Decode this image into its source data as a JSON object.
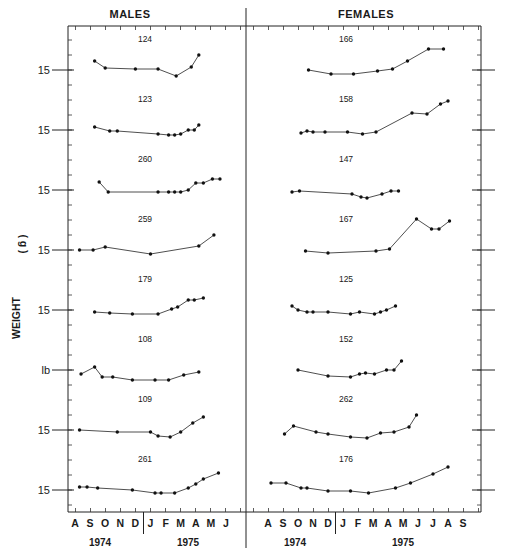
{
  "chart_data": {
    "type": "line",
    "title": "",
    "ylabel": "WEIGHT (g)",
    "xlabel": "",
    "reference_label": "15",
    "reference_unit": "g",
    "grid": false,
    "panels": [
      {
        "title": "MALES",
        "months": [
          "A",
          "S",
          "O",
          "N",
          "D",
          "J",
          "F",
          "M",
          "A",
          "M",
          "J"
        ],
        "years": [
          {
            "label": "1974",
            "span": [
              "A",
              "D"
            ]
          },
          {
            "label": "1975",
            "span": [
              "J",
              "J"
            ]
          }
        ],
        "series": [
          {
            "name": "124",
            "x": [
              1.3,
              2.0,
              4.0,
              5.5,
              6.7,
              7.7,
              8.2
            ],
            "y": [
              15.9,
              15.2,
              15.1,
              15.1,
              14.4,
              15.3,
              16.5
            ]
          },
          {
            "name": "123",
            "x": [
              1.3,
              2.3,
              2.8,
              5.5,
              6.2,
              6.6,
              7.0,
              7.5,
              7.9,
              8.2
            ],
            "y": [
              15.3,
              14.9,
              14.9,
              14.6,
              14.5,
              14.5,
              14.6,
              15.0,
              15.0,
              15.5
            ]
          },
          {
            "name": "260",
            "x": [
              1.6,
              2.2,
              5.5,
              6.2,
              6.6,
              7.0,
              7.5,
              8.0,
              8.5,
              9.1,
              9.6
            ],
            "y": [
              15.8,
              14.8,
              14.8,
              14.8,
              14.8,
              14.8,
              15.0,
              15.7,
              15.7,
              16.1,
              16.1
            ]
          },
          {
            "name": "259",
            "x": [
              0.3,
              1.2,
              2.0,
              5.0,
              8.2,
              9.2
            ],
            "y": [
              15.0,
              15.0,
              15.3,
              14.6,
              15.4,
              16.5
            ]
          },
          {
            "name": "179",
            "x": [
              1.3,
              2.3,
              3.8,
              5.5,
              6.4,
              6.8,
              7.5,
              7.9,
              8.5
            ],
            "y": [
              14.8,
              14.7,
              14.6,
              14.6,
              15.1,
              15.3,
              16.0,
              16.0,
              16.2
            ]
          },
          {
            "name": "108",
            "x": [
              0.4,
              1.3,
              1.8,
              2.5,
              3.8,
              5.3,
              6.2,
              7.2,
              8.2
            ],
            "y": [
              14.6,
              15.3,
              14.3,
              14.3,
              14.0,
              14.0,
              14.0,
              14.5,
              14.8
            ]
          },
          {
            "name": "109",
            "x": [
              0.3,
              2.8,
              5.0,
              5.5,
              6.3,
              7.0,
              7.8,
              8.5
            ],
            "y": [
              15.0,
              14.8,
              14.8,
              14.4,
              14.3,
              14.8,
              15.7,
              16.3
            ]
          },
          {
            "name": "261",
            "x": [
              0.3,
              0.8,
              1.5,
              3.8,
              5.3,
              5.7,
              6.6,
              7.5,
              8.0,
              8.5,
              9.5
            ],
            "y": [
              15.3,
              15.3,
              15.2,
              15.0,
              14.7,
              14.7,
              14.7,
              15.2,
              15.6,
              16.1,
              16.7
            ]
          }
        ]
      },
      {
        "title": "FEMALES",
        "months": [
          "A",
          "S",
          "O",
          "N",
          "D",
          "J",
          "F",
          "M",
          "A",
          "M",
          "J",
          "J",
          "A",
          "S"
        ],
        "years": [
          {
            "label": "1974",
            "span": [
              "A",
              "D"
            ]
          },
          {
            "label": "1975",
            "span": [
              "J",
              "S"
            ]
          }
        ],
        "series": [
          {
            "name": "166",
            "x": [
              2.7,
              4.2,
              5.7,
              7.3,
              8.3,
              9.3,
              10.7,
              11.7
            ],
            "y": [
              15.0,
              14.6,
              14.6,
              14.9,
              15.1,
              15.9,
              17.1,
              17.1
            ]
          },
          {
            "name": "158",
            "x": [
              2.2,
              2.6,
              3.0,
              3.8,
              5.3,
              6.3,
              7.2,
              9.6,
              10.6,
              11.5,
              12.0
            ],
            "y": [
              14.7,
              14.9,
              14.8,
              14.8,
              14.8,
              14.6,
              14.8,
              16.7,
              16.6,
              17.6,
              17.9
            ]
          },
          {
            "name": "147",
            "x": [
              1.6,
              2.1,
              5.6,
              6.2,
              6.6,
              7.6,
              8.2,
              8.7
            ],
            "y": [
              14.8,
              14.9,
              14.6,
              14.3,
              14.2,
              14.6,
              14.9,
              14.9
            ]
          },
          {
            "name": "167",
            "x": [
              2.5,
              4.0,
              7.2,
              8.1,
              9.9,
              10.9,
              11.4,
              12.1
            ],
            "y": [
              14.9,
              14.7,
              14.9,
              15.1,
              18.1,
              17.1,
              17.1,
              17.9
            ]
          },
          {
            "name": "125",
            "x": [
              1.6,
              2.0,
              2.6,
              3.0,
              4.0,
              5.5,
              6.1,
              7.1,
              7.5,
              7.9,
              8.5
            ],
            "y": [
              15.4,
              15.0,
              14.8,
              14.8,
              14.8,
              14.6,
              14.8,
              14.6,
              14.8,
              15.0,
              15.4
            ]
          },
          {
            "name": "152",
            "x": [
              2.0,
              4.0,
              5.5,
              6.1,
              6.5,
              7.1,
              7.9,
              8.4,
              8.9
            ],
            "y": [
              15.0,
              14.4,
              14.3,
              14.6,
              14.7,
              14.6,
              15.0,
              15.0,
              15.9
            ]
          },
          {
            "name": "262",
            "x": [
              1.1,
              1.7,
              3.2,
              4.0,
              5.5,
              6.6,
              7.5,
              8.4,
              9.4,
              9.9
            ],
            "y": [
              14.6,
              15.4,
              14.8,
              14.6,
              14.3,
              14.2,
              14.7,
              14.8,
              15.3,
              16.5
            ]
          },
          {
            "name": "176",
            "x": [
              0.2,
              1.2,
              2.2,
              2.6,
              4.0,
              5.5,
              6.7,
              8.5,
              9.5,
              11.0,
              12.0
            ],
            "y": [
              15.7,
              15.7,
              15.2,
              15.2,
              14.9,
              14.9,
              14.7,
              15.2,
              15.7,
              16.6,
              17.3
            ]
          }
        ]
      }
    ]
  },
  "labels": {
    "males_title": "MALES",
    "females_title": "FEMALES",
    "y_axis_word": "WEIGHT",
    "y_axis_unit": "( g )",
    "reference_labels": [
      "15",
      "15",
      "15",
      "15",
      "15",
      "lb",
      "15",
      "15"
    ],
    "year_1974": "1974",
    "year_1975": "1975"
  },
  "colors": {
    "ink": "#1a1a1a",
    "background": "#ffffff"
  }
}
